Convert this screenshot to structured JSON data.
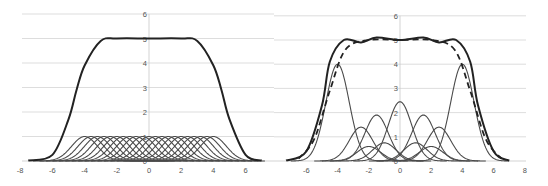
{
  "chart_data": [
    {
      "type": "line",
      "title": "",
      "xlabel": "",
      "ylabel": "",
      "xlim": [
        -8,
        7.7
      ],
      "ylim": [
        0,
        6
      ],
      "grid": true,
      "legend": "none",
      "x_ticks": [
        "-8",
        "-6",
        "-4",
        "-2",
        "0",
        "2",
        "4",
        "6"
      ],
      "y_ticks": [
        "0",
        "1",
        "2",
        "3",
        "4",
        "5",
        "6"
      ],
      "description": "Sum of many equal-height Gaussian components forms a flat-top plateau",
      "components": {
        "shape": "gaussian",
        "height": 1,
        "sigma": 0.8,
        "centers": [
          -4,
          -3.6,
          -3.2,
          -2.8,
          -2.4,
          -2,
          -1.6,
          -1.2,
          -0.8,
          -0.4,
          0,
          0.4,
          0.8,
          1.2,
          1.6,
          2,
          2.4,
          2.8,
          3.2,
          3.6,
          4
        ]
      },
      "series": [
        {
          "name": "sum",
          "style": "solid-thick",
          "x": [
            -7.5,
            -6,
            -5,
            -4.5,
            -4,
            -3,
            -2,
            0,
            2,
            3,
            4,
            4.5,
            5,
            6,
            7
          ],
          "values": [
            0.02,
            0.25,
            1.7,
            2.9,
            3.9,
            4.9,
            5.0,
            5.0,
            5.0,
            4.9,
            3.9,
            2.9,
            1.7,
            0.25,
            0.02
          ]
        }
      ],
      "color": "#333333"
    },
    {
      "type": "line",
      "title": "",
      "xlabel": "",
      "ylabel": "",
      "xlim": [
        -7.8,
        8
      ],
      "ylim": [
        0,
        6
      ],
      "grid": true,
      "legend": "none",
      "x_ticks": [
        "-6",
        "-4",
        "-2",
        "0",
        "2",
        "4",
        "6",
        "8"
      ],
      "y_ticks": [
        "0",
        "1",
        "2",
        "3",
        "4",
        "5",
        "6"
      ],
      "description": "Sum of unequal Gaussian components (solid, wavy top) versus target plateau (dashed)",
      "components": [
        {
          "center": -4,
          "height": 4.0,
          "sigma": 0.75
        },
        {
          "center": 4,
          "height": 4.0,
          "sigma": 0.75
        },
        {
          "center": -2.5,
          "height": 1.4,
          "sigma": 0.75
        },
        {
          "center": 2.5,
          "height": 1.4,
          "sigma": 0.75
        },
        {
          "center": -1.5,
          "height": 1.9,
          "sigma": 0.75
        },
        {
          "center": 1.5,
          "height": 1.9,
          "sigma": 0.75
        },
        {
          "center": 0,
          "height": 2.45,
          "sigma": 0.75
        },
        {
          "center": -1,
          "height": 0.75,
          "sigma": 0.75
        },
        {
          "center": 1,
          "height": 0.75,
          "sigma": 0.75
        },
        {
          "center": -2,
          "height": 0.6,
          "sigma": 0.75
        },
        {
          "center": 2,
          "height": 0.6,
          "sigma": 0.75
        }
      ],
      "series": [
        {
          "name": "sum",
          "style": "solid-thick",
          "x": [
            -7.3,
            -6,
            -5,
            -4.5,
            -3.6,
            -2.5,
            -1.5,
            0,
            1.5,
            2.5,
            3.6,
            4.5,
            5,
            6,
            7
          ],
          "values": [
            0.02,
            0.4,
            2.3,
            4.1,
            5.0,
            4.9,
            5.1,
            5.0,
            5.1,
            4.9,
            5.0,
            4.1,
            2.3,
            0.4,
            0.02
          ]
        },
        {
          "name": "target",
          "style": "dashed",
          "x": [
            -6.5,
            -5.5,
            -4.5,
            -3.5,
            -2,
            0,
            2,
            3.5,
            4.5,
            5.5,
            6.5
          ],
          "values": [
            0.1,
            0.9,
            2.9,
            4.6,
            5.0,
            5.0,
            5.0,
            4.6,
            2.9,
            0.9,
            0.1
          ]
        }
      ],
      "color": "#333333"
    }
  ]
}
